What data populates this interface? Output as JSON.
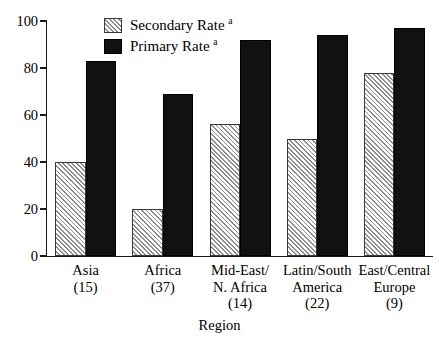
{
  "chart_data": {
    "type": "bar",
    "title": "",
    "xlabel": "Region",
    "ylabel": "",
    "ylim": [
      0,
      100
    ],
    "yticks": [
      0,
      20,
      40,
      60,
      80,
      100
    ],
    "grid": false,
    "legend_position": "top-center",
    "categories": [
      "Asia\n(15)",
      "Africa\n(37)",
      "Mid-East/\nN. Africa\n(14)",
      "Latin/South\nAmerica\n(22)",
      "East/Central\nEurope\n(9)"
    ],
    "category_lines": [
      [
        "Asia",
        "(15)"
      ],
      [
        "Africa",
        "(37)"
      ],
      [
        "Mid-East/",
        "N. Africa",
        "(14)"
      ],
      [
        "Latin/South",
        "America",
        "(22)"
      ],
      [
        "East/Central",
        "Europe",
        "(9)"
      ]
    ],
    "category_counts": [
      15,
      37,
      14,
      22,
      9
    ],
    "series": [
      {
        "name": "Secondary Rate",
        "footnote": "a",
        "fill": "hatched",
        "color": "#f2f2f2",
        "values": [
          40,
          20,
          56,
          50,
          78
        ]
      },
      {
        "name": "Primary Rate",
        "footnote": "a",
        "fill": "solid",
        "color": "#111111",
        "values": [
          83,
          69,
          92,
          94,
          97
        ]
      }
    ]
  },
  "axis": {
    "y_tick_labels": [
      "0",
      "20",
      "40",
      "60",
      "80",
      "100"
    ],
    "x_title": "Region"
  },
  "legend": {
    "items": [
      {
        "label": "Secondary Rate",
        "sup": "a"
      },
      {
        "label": "Primary Rate",
        "sup": "a"
      }
    ]
  }
}
